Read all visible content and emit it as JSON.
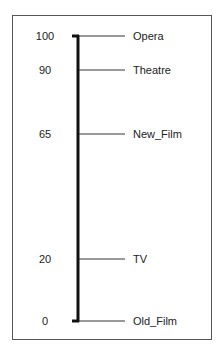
{
  "chart_data": {
    "type": "scale-diagram",
    "title": "",
    "axis": {
      "min": 0,
      "max": 100,
      "orientation": "vertical"
    },
    "points": [
      {
        "value": 100,
        "label": "Opera"
      },
      {
        "value": 90,
        "label": "Theatre"
      },
      {
        "value": 65,
        "label": "New_Film"
      },
      {
        "value": 20,
        "label": "TV"
      },
      {
        "value": 0,
        "label": "Old_Film"
      }
    ],
    "tick_labels": [
      "100",
      "90",
      "65",
      "20",
      "0"
    ],
    "colors": {
      "axis": "#111111",
      "tick": "#333333",
      "frame": "#555555",
      "text": "#222222"
    }
  },
  "ticks": [
    {
      "value": "100",
      "label": "Opera",
      "y": 36
    },
    {
      "value": "90",
      "label": "Theatre",
      "y": 70
    },
    {
      "value": "65",
      "label": "New_Film",
      "y": 134
    },
    {
      "value": "20",
      "label": "TV",
      "y": 259
    },
    {
      "value": "0",
      "label": "Old_Film",
      "y": 321
    }
  ]
}
